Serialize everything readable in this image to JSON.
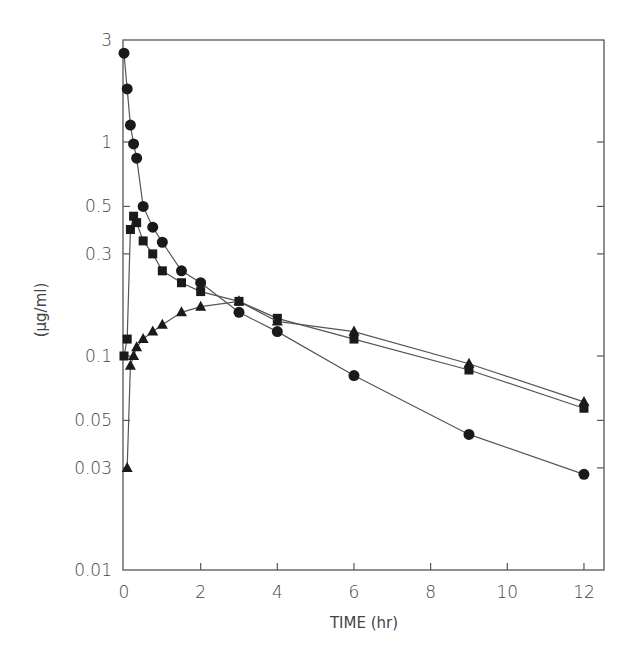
{
  "chart_data": {
    "type": "line",
    "title": "",
    "xlabel": "TIME (hr)",
    "ylabel": "(μg/ml)",
    "yscale": "log",
    "xlim": [
      0,
      12.5
    ],
    "ylim": [
      0.01,
      3
    ],
    "grid": false,
    "legend": "none",
    "x_ticks": [
      0,
      2,
      4,
      6,
      8,
      10,
      12
    ],
    "x_tick_labels": [
      "0",
      "2",
      "4",
      "6",
      "8",
      "10",
      "12"
    ],
    "y_ticks": [
      0.01,
      0.03,
      0.05,
      0.1,
      0.3,
      0.5,
      1,
      3
    ],
    "y_tick_labels": [
      "0.01",
      "0.03",
      "0.05",
      "0.1",
      "0.3",
      "0.5",
      "1",
      "3"
    ],
    "series": [
      {
        "name": "circles",
        "marker": "circle",
        "x": [
          0,
          0.083,
          0.167,
          0.25,
          0.33,
          0.5,
          0.75,
          1,
          1.5,
          2,
          3,
          4,
          6,
          9,
          12
        ],
        "values": [
          2.6,
          1.77,
          1.2,
          0.98,
          0.84,
          0.5,
          0.4,
          0.34,
          0.25,
          0.22,
          0.16,
          0.13,
          0.081,
          0.043,
          0.028
        ]
      },
      {
        "name": "squares",
        "marker": "square",
        "x": [
          0,
          0.083,
          0.167,
          0.25,
          0.33,
          0.5,
          0.75,
          1,
          1.5,
          2,
          3,
          4,
          6,
          9,
          12
        ],
        "values": [
          0.1,
          0.12,
          0.39,
          0.45,
          0.42,
          0.345,
          0.3,
          0.25,
          0.22,
          0.2,
          0.18,
          0.15,
          0.12,
          0.086,
          0.057
        ]
      },
      {
        "name": "triangles",
        "marker": "triangle",
        "x": [
          0.083,
          0.167,
          0.25,
          0.33,
          0.5,
          0.75,
          1,
          1.5,
          2,
          3,
          4,
          6,
          9,
          12
        ],
        "values": [
          0.03,
          0.09,
          0.1,
          0.11,
          0.12,
          0.13,
          0.14,
          0.16,
          0.17,
          0.18,
          0.145,
          0.13,
          0.092,
          0.061
        ]
      }
    ]
  }
}
